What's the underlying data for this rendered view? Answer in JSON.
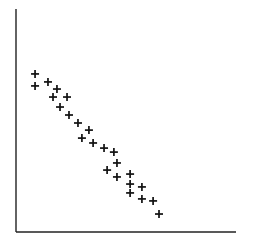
{
  "chart_data": {
    "type": "scatter",
    "title": "",
    "xlabel": "",
    "ylabel": "",
    "grid": false,
    "legend": null,
    "marker": "+",
    "axis_color": "#222222",
    "marker_color": "#111111",
    "note": "No tick labels shown; coordinates given in plot-relative units (0-100) estimated from pixel positions, origin at bottom-left of axes.",
    "xlim": [
      0,
      100
    ],
    "ylim": [
      0,
      100
    ],
    "points": [
      {
        "x": 8.7,
        "y": 71.2
      },
      {
        "x": 8.7,
        "y": 65.8
      },
      {
        "x": 14.6,
        "y": 67.6
      },
      {
        "x": 18.7,
        "y": 64.4
      },
      {
        "x": 16.9,
        "y": 60.8
      },
      {
        "x": 23.3,
        "y": 60.8
      },
      {
        "x": 20.1,
        "y": 56.3
      },
      {
        "x": 24.2,
        "y": 52.7
      },
      {
        "x": 28.3,
        "y": 49.1
      },
      {
        "x": 33.3,
        "y": 45.9
      },
      {
        "x": 30.1,
        "y": 42.3
      },
      {
        "x": 35.2,
        "y": 40.1
      },
      {
        "x": 40.2,
        "y": 37.8
      },
      {
        "x": 44.7,
        "y": 36.0
      },
      {
        "x": 46.1,
        "y": 31.1
      },
      {
        "x": 41.6,
        "y": 27.9
      },
      {
        "x": 46.1,
        "y": 24.8
      },
      {
        "x": 52.1,
        "y": 26.1
      },
      {
        "x": 52.1,
        "y": 21.6
      },
      {
        "x": 52.1,
        "y": 17.6
      },
      {
        "x": 57.5,
        "y": 20.3
      },
      {
        "x": 57.5,
        "y": 14.9
      },
      {
        "x": 62.6,
        "y": 14.0
      },
      {
        "x": 65.3,
        "y": 8.1
      }
    ],
    "pixel_frame": {
      "x0": 16,
      "y0": 232,
      "x1": 235,
      "y1": 10
    }
  }
}
